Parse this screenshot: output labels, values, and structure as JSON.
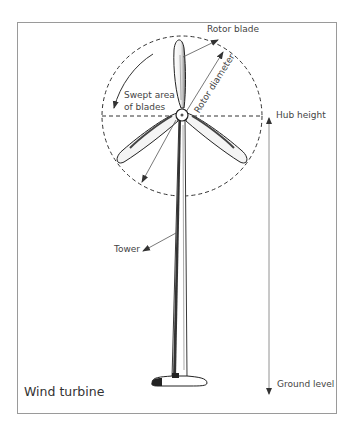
{
  "title": "Wind turbine",
  "labels": {
    "rotor_blade": "Rotor blade",
    "rotor_diameter": "Rotor diameter",
    "swept_area_line1": "Swept area",
    "swept_area_line2": "of blades",
    "hub_height": "Hub height",
    "tower": "Tower",
    "ground_level": "Ground level"
  },
  "colors": {
    "frame": "#9a9a9a",
    "line": "#222222",
    "annotation": "#555555",
    "text": "#444444"
  },
  "geometry": {
    "frame": {
      "x": 17,
      "y": 22,
      "w": 319,
      "h": 391
    },
    "hub": {
      "cx": 182,
      "cy": 115,
      "r": 6
    },
    "swept_circle": {
      "cx": 182,
      "cy": 116,
      "r": 80
    },
    "hub_line_y": 116,
    "hub_height_arrow": {
      "x": 269,
      "y1": 114,
      "y2": 396
    },
    "tower": {
      "top": 120,
      "base": 378
    },
    "ground_y": 383
  }
}
